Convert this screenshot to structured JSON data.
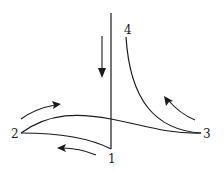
{
  "diagram": {
    "type": "cycle-path-diagram",
    "points": [
      {
        "id": "1",
        "label": "1"
      },
      {
        "id": "2",
        "label": "2"
      },
      {
        "id": "3",
        "label": "3"
      },
      {
        "id": "4",
        "label": "4"
      }
    ],
    "edges": [
      {
        "from": "4",
        "to": "1",
        "shape": "vertical-line",
        "direction": "down"
      },
      {
        "from": "1",
        "to": "2",
        "shape": "curve",
        "direction": "left"
      },
      {
        "from": "2",
        "to": "3",
        "shape": "curve",
        "direction": "right"
      },
      {
        "from": "3",
        "to": "4",
        "shape": "curve",
        "direction": "up-left"
      }
    ],
    "arrows": [
      {
        "id": "arrow-down",
        "direction": "down"
      },
      {
        "id": "arrow-left-bottom",
        "direction": "left"
      },
      {
        "id": "arrow-right-top",
        "direction": "right"
      },
      {
        "id": "arrow-up-left",
        "direction": "up-left"
      }
    ],
    "colors": {
      "ink": "#1a1a1a",
      "background": "#ffffff"
    }
  }
}
